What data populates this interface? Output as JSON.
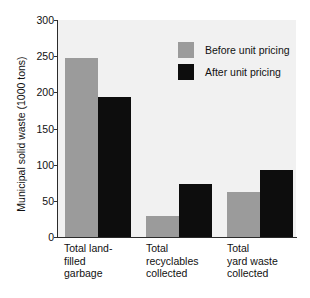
{
  "chart_data": {
    "type": "bar",
    "title": "",
    "xlabel": "",
    "ylabel": "Municipal solid waste (1000 tons)",
    "ylim": [
      0,
      300
    ],
    "yticks": [
      0,
      50,
      100,
      150,
      200,
      250,
      300
    ],
    "ytick_labels": [
      "0",
      "50",
      "100",
      "150",
      "200",
      "250",
      "300"
    ],
    "grid": false,
    "legend_position": "top-right",
    "categories": [
      "Total land-\nfilled\ngarbage",
      "Total\nrecyclables\ncollected",
      "Total\nyard waste\ncollected"
    ],
    "category_lines": [
      [
        "Total land-",
        "filled",
        "garbage"
      ],
      [
        "Total",
        "recyclables",
        "collected"
      ],
      [
        "Total",
        "yard waste",
        "collected"
      ]
    ],
    "series": [
      {
        "name": "Before unit pricing",
        "color": "#9b9b9b",
        "values": [
          247,
          29,
          62
        ]
      },
      {
        "name": "After unit pricing",
        "color": "#0d0d0d",
        "values": [
          194,
          73,
          93
        ]
      }
    ]
  },
  "legend": {
    "items": [
      {
        "label": "Before unit pricing",
        "color": "#9b9b9b"
      },
      {
        "label": "After unit pricing",
        "color": "#0d0d0d"
      }
    ]
  },
  "axes": {
    "y_title": "Municipal solid waste (1000 tons)",
    "y_tick_labels": [
      "300",
      "250",
      "200",
      "150",
      "100",
      "50",
      "0"
    ]
  },
  "colors": {
    "plot_background": "#f1f1f1",
    "axis": "#2b2b2b",
    "text": "#111111",
    "before_series": "#9b9b9b",
    "after_series": "#0d0d0d"
  }
}
